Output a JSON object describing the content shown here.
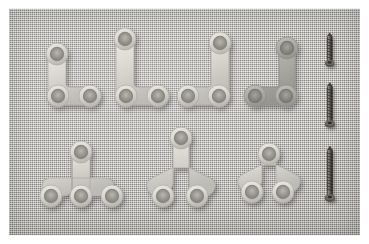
{
  "scene": {
    "title": "Orthopedic mini bone plates and screws on woven cloth",
    "subject": "surgical-fixation-hardware",
    "description": "Seven titanium Y-shaped and T-shaped mini bone plates arranged in two rows on a gray woven fabric drape, with three cortical screws of increasing length at the right edge.",
    "photo_border_color": "#ffffff",
    "photo_border_px": 8
  },
  "background": {
    "name": "woven-cloth-drape",
    "base_color": "#b4b2ad",
    "highlight_color": "#c9c7c2",
    "shadow_color": "#8e8c88",
    "weave_pitch_px": 2
  },
  "plates": {
    "metal_light": "#dedcd6",
    "metal_mid": "#c5c3bd",
    "metal_dark": "#a3a19b",
    "hole_inner": "#8d8b86",
    "shadow_color": "rgba(60,58,55,0.40)",
    "items": [
      {
        "id": "plate-1",
        "label": "Y-plate small, stem up-left",
        "row": "top",
        "position": 1,
        "hole_count": 3,
        "orientation": "stem-left",
        "tone": "light",
        "holes": [
          [
            48,
            55
          ],
          [
            49,
            97
          ],
          [
            81,
            97
          ]
        ]
      },
      {
        "id": "plate-2",
        "label": "Y-plate long stem, stem up-left",
        "row": "top",
        "position": 2,
        "hole_count": 3,
        "orientation": "stem-left",
        "tone": "light",
        "holes": [
          [
            116,
            40
          ],
          [
            117,
            97
          ],
          [
            149,
            97
          ]
        ]
      },
      {
        "id": "plate-3",
        "label": "Y-plate long stem, stem up-right",
        "row": "top",
        "position": 3,
        "hole_count": 3,
        "orientation": "stem-right",
        "tone": "light",
        "holes": [
          [
            211,
            44
          ],
          [
            180,
            97
          ],
          [
            211,
            97
          ]
        ]
      },
      {
        "id": "plate-4",
        "label": "Y-plate short stem, stem up-right, dark finish",
        "row": "top",
        "position": 4,
        "hole_count": 3,
        "orientation": "stem-right",
        "tone": "dark",
        "holes": [
          [
            277,
            49
          ],
          [
            247,
            97
          ],
          [
            277,
            97
          ]
        ]
      },
      {
        "id": "plate-5",
        "label": "T-plate four-hole, stem up-center",
        "row": "bottom",
        "position": 1,
        "hole_count": 4,
        "orientation": "stem-center",
        "tone": "light",
        "holes": [
          [
            72,
            152
          ],
          [
            43,
            196
          ],
          [
            72,
            196
          ],
          [
            104,
            196
          ]
        ]
      },
      {
        "id": "plate-6",
        "label": "Y-plate long stem, stem up-center",
        "row": "bottom",
        "position": 2,
        "hole_count": 3,
        "orientation": "stem-center",
        "tone": "light",
        "holes": [
          [
            173,
            139
          ],
          [
            155,
            196
          ],
          [
            189,
            196
          ]
        ]
      },
      {
        "id": "plate-7",
        "label": "Y-plate short stem, stem up-center",
        "row": "bottom",
        "position": 3,
        "hole_count": 3,
        "orientation": "stem-center",
        "tone": "light",
        "holes": [
          [
            261,
            154
          ],
          [
            244,
            192
          ],
          [
            275,
            192
          ]
        ]
      }
    ]
  },
  "screws": {
    "metal_dark": "#4a4742",
    "metal_mid": "#6e6a63",
    "metal_light": "#9b978f",
    "items": [
      {
        "id": "screw-1",
        "label": "Cortical screw short",
        "length_px": 34,
        "x": 330,
        "top_y": 36
      },
      {
        "id": "screw-2",
        "label": "Cortical screw medium",
        "length_px": 44,
        "x": 330,
        "top_y": 86
      },
      {
        "id": "screw-3",
        "label": "Cortical screw long",
        "length_px": 54,
        "x": 330,
        "top_y": 150
      }
    ]
  }
}
